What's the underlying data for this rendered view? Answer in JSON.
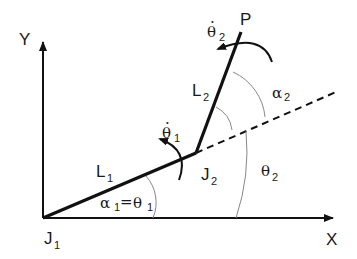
{
  "diagram": {
    "axes": {
      "x_label": "X",
      "y_label": "Y"
    },
    "joints": [
      {
        "name": "J",
        "sub": "1"
      },
      {
        "name": "J",
        "sub": "2"
      }
    ],
    "endpoint": {
      "label": "P"
    },
    "links": [
      {
        "name": "L",
        "sub": "1"
      },
      {
        "name": "L",
        "sub": "2"
      }
    ],
    "angles": {
      "alpha1_theta1": {
        "alpha": "α",
        "alpha_sub": "1",
        "eq": "=",
        "theta": "θ",
        "theta_sub": "1"
      },
      "theta2": {
        "symbol": "θ",
        "sub": "2"
      },
      "alpha2": {
        "symbol": "α",
        "sub": "2"
      }
    },
    "angular_velocities": [
      {
        "symbol": "θ̇",
        "base": "θ",
        "dot": "·",
        "sub": "1"
      },
      {
        "symbol": "θ̇",
        "base": "θ",
        "dot": "·",
        "sub": "2"
      }
    ],
    "colors": {
      "line": "#111111",
      "arc": "#888888",
      "background": "#ffffff"
    }
  }
}
